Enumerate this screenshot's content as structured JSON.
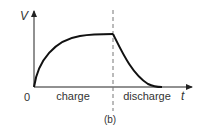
{
  "diagram": {
    "y_axis_label": "V",
    "x_axis_label": "t",
    "origin_label": "0",
    "phase_labels": [
      "charge",
      "discharge"
    ],
    "caption": "(b)",
    "colors": {
      "curve": "#111111",
      "axes": "#222222",
      "divider": "#777777",
      "text": "#333333"
    }
  }
}
